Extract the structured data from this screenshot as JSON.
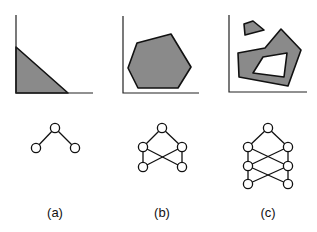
{
  "colors": {
    "region_fill": "#8a8a8a",
    "stroke": "#111111",
    "background": "#ffffff"
  },
  "panels": [
    {
      "label": "(a)",
      "plot": {
        "axes": {
          "origin": [
            16,
            93
          ],
          "y_top": 15,
          "x_right": 93
        },
        "regions": [
          {
            "type": "polygon",
            "points": [
              [
                16,
                47
              ],
              [
                68,
                93
              ],
              [
                16,
                93
              ]
            ]
          }
        ],
        "holes": []
      },
      "graph": {
        "nodes": [
          [
            55,
            128
          ],
          [
            36,
            148
          ],
          [
            75,
            148
          ]
        ],
        "edges": [
          [
            0,
            1
          ],
          [
            0,
            2
          ]
        ]
      }
    },
    {
      "label": "(b)",
      "plot": {
        "axes": {
          "origin": [
            123,
            93
          ],
          "y_top": 16,
          "x_right": 199
        },
        "regions": [
          {
            "type": "polygon",
            "points": [
              [
                137,
                43
              ],
              [
                171,
                34
              ],
              [
                191,
                67
              ],
              [
                178,
                88
              ],
              [
                138,
                88
              ],
              [
                128,
                68
              ]
            ]
          }
        ],
        "holes": []
      },
      "graph": {
        "nodes": [
          [
            162,
            128
          ],
          [
            143,
            147
          ],
          [
            182,
            147
          ],
          [
            143,
            167
          ],
          [
            182,
            167
          ]
        ],
        "edges": [
          [
            0,
            1
          ],
          [
            0,
            2
          ],
          [
            1,
            3
          ],
          [
            2,
            4
          ],
          [
            1,
            4
          ],
          [
            2,
            3
          ]
        ]
      }
    },
    {
      "label": "(c)",
      "plot": {
        "axes": {
          "origin": [
            229,
            92
          ],
          "y_top": 15,
          "x_right": 307
        },
        "regions": [
          {
            "type": "polygon",
            "points": [
              [
                244,
                24
              ],
              [
                253,
                21
              ],
              [
                264,
                30
              ],
              [
                245,
                35
              ]
            ]
          },
          {
            "type": "polygon",
            "points": [
              [
                238,
                53
              ],
              [
                265,
                48
              ],
              [
                281,
                29
              ],
              [
                301,
                50
              ],
              [
                288,
                86
              ],
              [
                239,
                77
              ]
            ]
          }
        ],
        "holes": [
          {
            "type": "polygon",
            "points": [
              [
                263,
                57
              ],
              [
                287,
                53
              ],
              [
                284,
                77
              ],
              [
                253,
                73
              ]
            ]
          }
        ]
      },
      "graph": {
        "nodes": [
          [
            268,
            128
          ],
          [
            248,
            147
          ],
          [
            288,
            147
          ],
          [
            248,
            166
          ],
          [
            288,
            166
          ],
          [
            248,
            184
          ],
          [
            288,
            184
          ]
        ],
        "edges": [
          [
            0,
            1
          ],
          [
            0,
            2
          ],
          [
            1,
            3
          ],
          [
            2,
            4
          ],
          [
            1,
            4
          ],
          [
            2,
            3
          ],
          [
            3,
            5
          ],
          [
            4,
            6
          ],
          [
            3,
            6
          ],
          [
            4,
            5
          ]
        ]
      }
    }
  ],
  "label_y": 217,
  "node_radius": 4.6
}
